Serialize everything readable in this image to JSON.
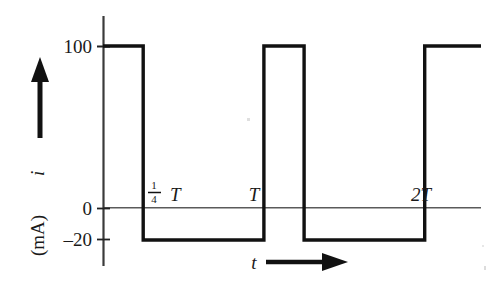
{
  "figure": {
    "type": "waveform-plot",
    "background_color": "#ffffff",
    "ink_color": "#111111",
    "axis_color": "#444444",
    "y_axis": {
      "label_quantity": "i",
      "label_unit": "(mA)",
      "arrow_direction": "up",
      "ticks": [
        {
          "label": "100",
          "value": 100
        },
        {
          "label": "0",
          "value": 0
        },
        {
          "label": "–20",
          "value": -20
        }
      ]
    },
    "x_axis": {
      "label": "t",
      "arrow_direction": "right",
      "ticks": [
        {
          "label_numerator": "1",
          "label_denominator": "4",
          "label_symbol": "T",
          "value": 0.25
        },
        {
          "label": "T",
          "value": 1
        },
        {
          "label": "2T",
          "value": 2
        }
      ]
    }
  },
  "chart_data": {
    "type": "line",
    "title": "",
    "subtitle": "",
    "xlabel": "t",
    "ylabel": "i (mA)",
    "waveform": "periodic rectangular pulse train",
    "period_label": "T",
    "duty_cycle": 0.25,
    "high_value": 100,
    "low_value": -20,
    "ylim": [
      -40,
      120
    ],
    "xlim": [
      0,
      2.35
    ],
    "grid": false,
    "legend": null,
    "y_ticks": [
      100,
      0,
      -20
    ],
    "y_ticklabels": [
      "100",
      "0",
      "–20"
    ],
    "x_ticks": [
      0.25,
      1,
      2
    ],
    "x_ticklabels": [
      "¼ T",
      "T",
      "2T"
    ],
    "x": [
      0,
      0.25,
      0.25,
      1.0,
      1.0,
      1.25,
      1.25,
      2.0,
      2.0,
      2.35
    ],
    "y": [
      100,
      100,
      -20,
      -20,
      100,
      100,
      -20,
      -20,
      100,
      100
    ],
    "segments": [
      {
        "from_x": 0,
        "to_x": 0.25,
        "value": 100
      },
      {
        "from_x": 0.25,
        "to_x": 1.0,
        "value": -20
      },
      {
        "from_x": 1.0,
        "to_x": 1.25,
        "value": 100
      },
      {
        "from_x": 1.25,
        "to_x": 2.0,
        "value": -20
      },
      {
        "from_x": 2.0,
        "to_x": 2.35,
        "value": 100
      }
    ]
  }
}
